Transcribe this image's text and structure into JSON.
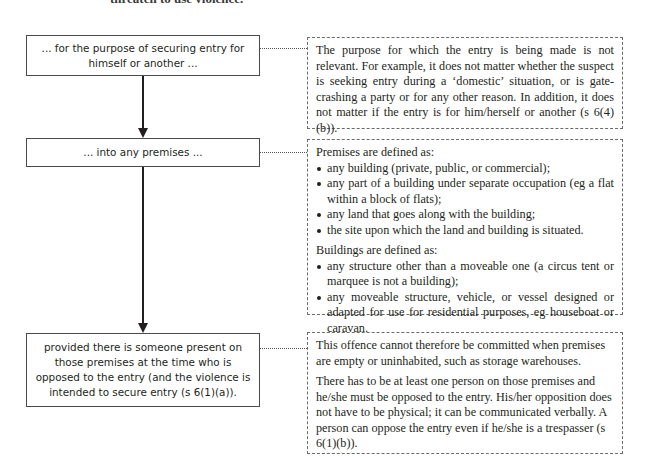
{
  "top_fragment": "threaten to use violence.",
  "flow_steps": [
    {
      "label": "... for the purpose of securing entry for himself or another ...",
      "note_paragraphs": [
        "The purpose for which the entry is being made is not relevant. For example, it does not matter whether the suspect is seeking entry during a ‘domestic’ situation, or is gate-crashing a party or for any other reason. In addition, it does not matter if the entry is for him/herself or another (s 6(4)(b))."
      ]
    },
    {
      "label": "... into any premises ...",
      "note": {
        "premises_heading": "Premises are defined as:",
        "premises_items": [
          "any building (private, public, or commercial);",
          "any part of a building under separate occupation (eg a flat within a block of flats);",
          "any land that goes along with the building;",
          "the site upon which the land and building is situated."
        ],
        "buildings_heading": "Buildings are defined as:",
        "buildings_items": [
          "any structure other than a moveable one (a circus tent or marquee is not a building);",
          "any moveable structure, vehicle, or vessel designed or adapted for use for residential purposes, eg houseboat or caravan."
        ]
      }
    },
    {
      "label": "provided there is someone present on those premises at the time who is opposed to the entry (and the violence is intended to secure entry (s 6(1)(a)).",
      "note_paragraphs": [
        "This offence cannot therefore be committed when premises are empty or uninhabited, such as storage warehouses.",
        "There has to be at least one person on those premises and he/she must be opposed to the entry. His/her opposition does not have to be physical; it can be communicated verbally. A person can oppose the entry even if he/she is a trespasser (s 6(1)(b))."
      ]
    }
  ]
}
